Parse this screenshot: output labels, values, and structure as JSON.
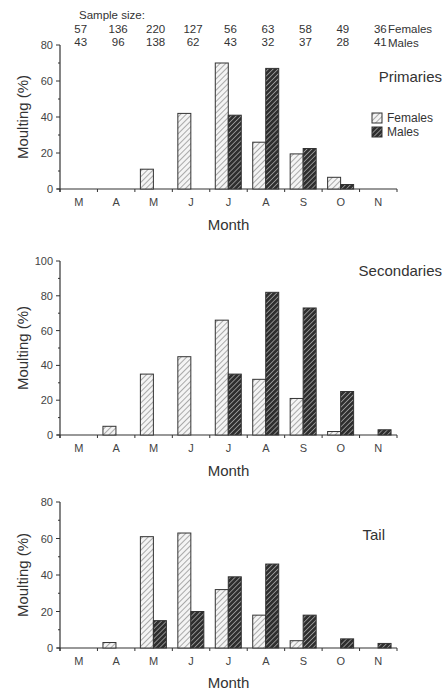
{
  "sample_size": {
    "label": "Sample size:",
    "females_label": "Females",
    "males_label": "Males",
    "females": [
      "57",
      "136",
      "220",
      "127",
      "56",
      "63",
      "58",
      "49",
      "36"
    ],
    "males": [
      "43",
      "96",
      "138",
      "62",
      "43",
      "32",
      "37",
      "28",
      "41"
    ]
  },
  "legend": {
    "females": "Females",
    "males": "Males",
    "placement": "right, in Primaries panel"
  },
  "colors": {
    "female_fill": "#f2f2f2",
    "male_fill": "#3a3a3a",
    "stroke": "#333333"
  },
  "chart_data": [
    {
      "type": "bar",
      "title": "Primaries",
      "xlabel": "Month",
      "ylabel": "Moulting (%)",
      "categories": [
        "M",
        "A",
        "M",
        "J",
        "J",
        "A",
        "S",
        "O",
        "N"
      ],
      "ylim": [
        0,
        80
      ],
      "yticks": [
        0,
        20,
        40,
        60,
        80
      ],
      "series": [
        {
          "name": "Females",
          "values": [
            0,
            0,
            11,
            42,
            70,
            26,
            19.5,
            6.5,
            0
          ]
        },
        {
          "name": "Males",
          "values": [
            0,
            0,
            0,
            0,
            41,
            67,
            22.5,
            2.5,
            0
          ]
        }
      ]
    },
    {
      "type": "bar",
      "title": "Secondaries",
      "xlabel": "Month",
      "ylabel": "Moulting (%)",
      "categories": [
        "M",
        "A",
        "M",
        "J",
        "J",
        "A",
        "S",
        "O",
        "N"
      ],
      "ylim": [
        0,
        100
      ],
      "yticks": [
        0,
        20,
        40,
        60,
        80,
        100
      ],
      "series": [
        {
          "name": "Females",
          "values": [
            0,
            5,
            35,
            45,
            66,
            32,
            21,
            2,
            0
          ]
        },
        {
          "name": "Males",
          "values": [
            0,
            0,
            0,
            0,
            35,
            82,
            73,
            25,
            3
          ]
        }
      ]
    },
    {
      "type": "bar",
      "title": "Tail",
      "xlabel": "Month",
      "ylabel": "Moulting (%)",
      "categories": [
        "M",
        "A",
        "M",
        "J",
        "J",
        "A",
        "S",
        "O",
        "N"
      ],
      "ylim": [
        0,
        80
      ],
      "yticks": [
        0,
        20,
        40,
        60,
        80
      ],
      "series": [
        {
          "name": "Females",
          "values": [
            0,
            3,
            61,
            63,
            32,
            18,
            4,
            0,
            0
          ]
        },
        {
          "name": "Males",
          "values": [
            0,
            0,
            15,
            20,
            39,
            46,
            18,
            5,
            2.5
          ]
        }
      ]
    }
  ]
}
